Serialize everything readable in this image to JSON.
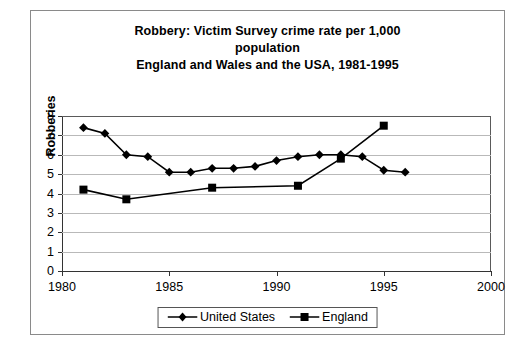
{
  "chart_data": {
    "type": "line",
    "title": "Robbery: Victim Survey crime rate per 1,000 population\nEngland and Wales and the USA, 1981-1995",
    "title_lines": [
      "Robbery: Victim Survey crime rate per 1,000",
      "population",
      "England and Wales and the USA, 1981-1995"
    ],
    "xlabel": "",
    "ylabel": "Robberies",
    "xlim": [
      1980,
      2000
    ],
    "ylim": [
      0,
      8
    ],
    "xticks": [
      1980,
      1985,
      1990,
      1995,
      2000
    ],
    "yticks": [
      0,
      1,
      2,
      3,
      4,
      5,
      6,
      7,
      8
    ],
    "grid": "horizontal",
    "legend_position": "bottom",
    "series": [
      {
        "name": "United States",
        "marker": "diamond",
        "color": "#000000",
        "x": [
          1981,
          1982,
          1983,
          1984,
          1985,
          1986,
          1987,
          1988,
          1989,
          1990,
          1991,
          1992,
          1993,
          1994,
          1995,
          1996
        ],
        "values": [
          7.4,
          7.1,
          6.0,
          5.9,
          5.1,
          5.1,
          5.3,
          5.3,
          5.4,
          5.7,
          5.9,
          6.0,
          6.0,
          5.9,
          5.2,
          5.1
        ]
      },
      {
        "name": "England",
        "marker": "square",
        "color": "#000000",
        "x": [
          1981,
          1983,
          1987,
          1991,
          1993,
          1995
        ],
        "values": [
          4.2,
          3.7,
          4.3,
          4.4,
          5.8,
          7.5
        ]
      }
    ]
  },
  "legend": {
    "items": [
      {
        "label": "United States"
      },
      {
        "label": "England"
      }
    ]
  },
  "axes": {
    "y_title": "Robberies",
    "y_tick_labels": [
      "0",
      "1",
      "2",
      "3",
      "4",
      "5",
      "6",
      "7",
      "8"
    ],
    "x_tick_labels": [
      "1980",
      "1985",
      "1990",
      "1995",
      "2000"
    ]
  }
}
